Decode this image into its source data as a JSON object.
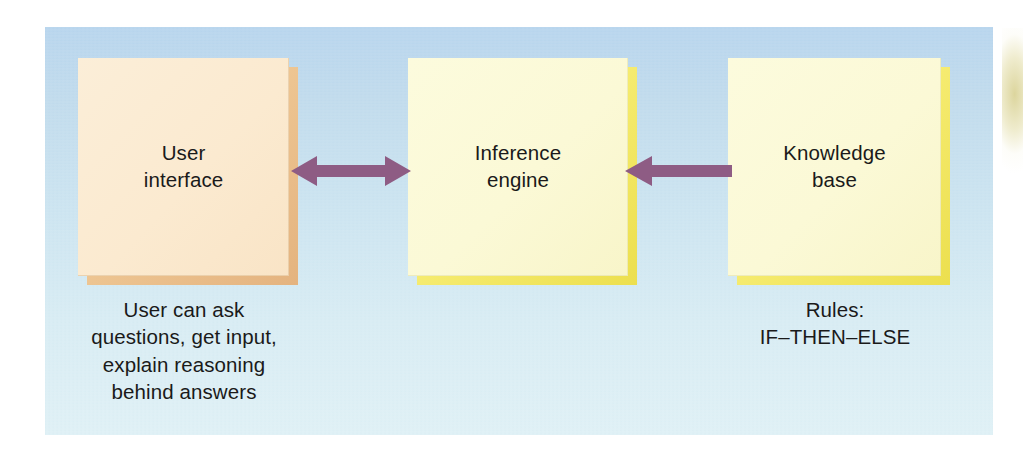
{
  "figure": {
    "panel_background_top": "#b9d6ee",
    "panel_background_bottom": "#e0f1f6"
  },
  "nodes": [
    {
      "id": "user-interface",
      "label": "User\ninterface",
      "face_color": "#fbead0",
      "shadow_color": "#e8b987"
    },
    {
      "id": "inference-engine",
      "label": "Inference\nengine",
      "face_color": "#fbf9d6",
      "shadow_color": "#f2e65c"
    },
    {
      "id": "knowledge-base",
      "label": "Knowledge\nbase",
      "face_color": "#fbf9d6",
      "shadow_color": "#f2e65c"
    }
  ],
  "arrows": [
    {
      "id": "ui-inference",
      "from": "user-interface",
      "to": "inference-engine",
      "direction": "bidirectional",
      "color": "#8e5c84"
    },
    {
      "id": "kb-inference",
      "from": "knowledge-base",
      "to": "inference-engine",
      "direction": "left",
      "color": "#8e5c84"
    }
  ],
  "captions": {
    "user_interface": "User can ask\nquestions, get input,\nexplain reasoning\nbehind answers",
    "knowledge_base": "Rules:\nIF–THEN–ELSE"
  }
}
